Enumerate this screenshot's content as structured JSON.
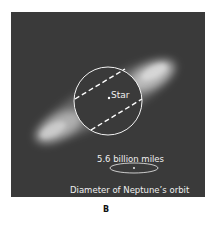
{
  "figure": {
    "panel_letter": "B",
    "colors": {
      "background": "#3a3a3a",
      "nebula": "#cfcfcf",
      "lines": "#ffffff",
      "caption_letter": "#111111"
    },
    "labels": {
      "star": "Star",
      "scale": "5.6 billion miles",
      "orbit": "Diameter of Neptune’s orbit"
    }
  }
}
